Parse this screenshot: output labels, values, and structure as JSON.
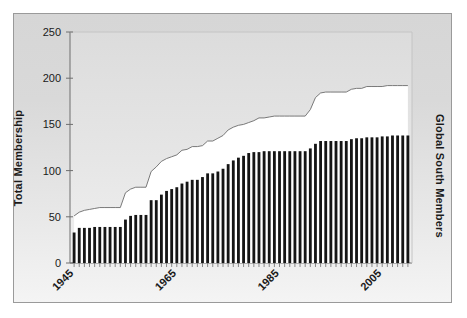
{
  "chart_data": {
    "type": "area",
    "title": "",
    "subtitle": "",
    "xlabel": "",
    "ylabel": "Total Membership",
    "y2label": "Global South Members",
    "xlim": [
      1945,
      2010
    ],
    "ylim": [
      0,
      250
    ],
    "y_ticks": [
      0,
      50,
      100,
      150,
      200,
      250
    ],
    "x_ticks": [
      1945,
      1965,
      1985,
      2005
    ],
    "x_tick_labels": [
      "1945",
      "1965",
      "1985",
      "2005"
    ],
    "grid": false,
    "legend": null,
    "colors": {
      "area_fill": "#ffffff",
      "area_line": "#6b6b6b",
      "bar_fill": "#151515",
      "plot_background": "#e4e4e4",
      "figure_background": "#ffffff",
      "frame_border": "#9a9a9a",
      "axis": "#555555",
      "text": "#1a1a1a"
    },
    "x": [
      1945,
      1946,
      1947,
      1948,
      1949,
      1950,
      1951,
      1952,
      1953,
      1954,
      1955,
      1956,
      1957,
      1958,
      1959,
      1960,
      1961,
      1962,
      1963,
      1964,
      1965,
      1966,
      1967,
      1968,
      1969,
      1970,
      1971,
      1972,
      1973,
      1974,
      1975,
      1976,
      1977,
      1978,
      1979,
      1980,
      1981,
      1982,
      1983,
      1984,
      1985,
      1986,
      1987,
      1988,
      1989,
      1990,
      1991,
      1992,
      1993,
      1994,
      1995,
      1996,
      1997,
      1998,
      1999,
      2000,
      2001,
      2002,
      2003,
      2004,
      2005,
      2006,
      2007,
      2008,
      2009,
      2010
    ],
    "series": [
      {
        "name": "Total Membership",
        "render": "area",
        "values": [
          51,
          55,
          57,
          58,
          59,
          60,
          60,
          60,
          60,
          60,
          76,
          80,
          82,
          82,
          82,
          99,
          104,
          110,
          113,
          115,
          117,
          122,
          123,
          126,
          126,
          127,
          132,
          132,
          135,
          138,
          144,
          147,
          149,
          150,
          152,
          154,
          157,
          157,
          158,
          159,
          159,
          159,
          159,
          159,
          159,
          159,
          166,
          179,
          184,
          185,
          185,
          185,
          185,
          185,
          188,
          189,
          189,
          191,
          191,
          191,
          191,
          192,
          192,
          192,
          192,
          192
        ]
      },
      {
        "name": "Global South Members",
        "render": "bar",
        "values": [
          33,
          38,
          38,
          38,
          39,
          39,
          39,
          39,
          39,
          39,
          47,
          51,
          52,
          52,
          52,
          68,
          68,
          74,
          78,
          80,
          82,
          86,
          88,
          90,
          90,
          93,
          97,
          97,
          99,
          102,
          107,
          111,
          114,
          116,
          119,
          120,
          120,
          121,
          121,
          121,
          121,
          121,
          121,
          121,
          121,
          121,
          124,
          129,
          132,
          132,
          132,
          132,
          132,
          132,
          134,
          135,
          135,
          136,
          136,
          136,
          137,
          137,
          138,
          138,
          138,
          138
        ]
      }
    ]
  }
}
